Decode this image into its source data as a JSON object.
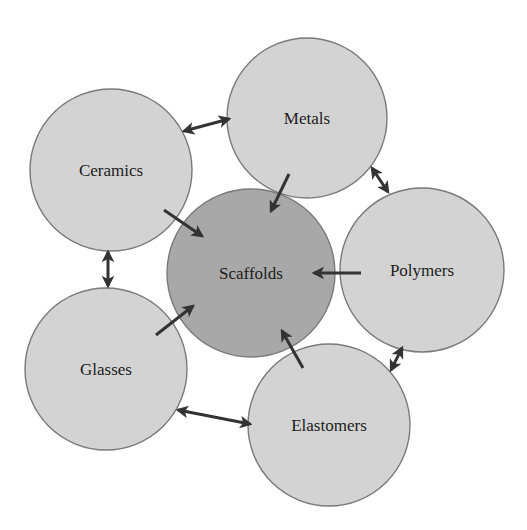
{
  "diagram": {
    "type": "hub-and-spoke",
    "colors": {
      "outer_fill": "#d3d3d3",
      "hub_fill": "#a8a8a8",
      "stroke": "#7a7a7a",
      "arrow": "#333333",
      "text": "#1c1c1c"
    },
    "hub": {
      "id": "scaffolds",
      "label": "Scaffolds",
      "cx": 251,
      "cy": 273,
      "r": 84
    },
    "nodes": [
      {
        "id": "metals",
        "label": "Metals",
        "cx": 307,
        "cy": 118,
        "r": 80
      },
      {
        "id": "ceramics",
        "label": "Ceramics",
        "cx": 111,
        "cy": 170,
        "r": 81
      },
      {
        "id": "polymers",
        "label": "Polymers",
        "cx": 422,
        "cy": 270,
        "r": 82
      },
      {
        "id": "glasses",
        "label": "Glasses",
        "cx": 106,
        "cy": 369,
        "r": 81
      },
      {
        "id": "elastomers",
        "label": "Elastomers",
        "cx": 329,
        "cy": 425,
        "r": 81
      }
    ],
    "edges_to_hub": [
      {
        "from": "metals",
        "to": "scaffolds",
        "x1": 289,
        "y1": 174,
        "x2": 271,
        "y2": 211
      },
      {
        "from": "ceramics",
        "to": "scaffolds",
        "x1": 164,
        "y1": 210,
        "x2": 202,
        "y2": 236
      },
      {
        "from": "polymers",
        "to": "scaffolds",
        "x1": 361,
        "y1": 273,
        "x2": 314,
        "y2": 273
      },
      {
        "from": "glasses",
        "to": "scaffolds",
        "x1": 156,
        "y1": 335,
        "x2": 193,
        "y2": 306
      },
      {
        "from": "elastomers",
        "to": "scaffolds",
        "x1": 303,
        "y1": 368,
        "x2": 282,
        "y2": 331
      }
    ],
    "edges_between": [
      {
        "from": "ceramics",
        "to": "metals",
        "x1": 184,
        "y1": 131,
        "x2": 229,
        "y2": 119
      },
      {
        "from": "metals",
        "to": "polymers",
        "x1": 372,
        "y1": 168,
        "x2": 388,
        "y2": 192
      },
      {
        "from": "polymers",
        "to": "elastomers",
        "x1": 402,
        "y1": 348,
        "x2": 391,
        "y2": 370
      },
      {
        "from": "glasses",
        "to": "elastomers",
        "x1": 178,
        "y1": 410,
        "x2": 250,
        "y2": 424
      },
      {
        "from": "ceramics",
        "to": "glasses",
        "x1": 108,
        "y1": 252,
        "x2": 108,
        "y2": 286
      }
    ]
  }
}
